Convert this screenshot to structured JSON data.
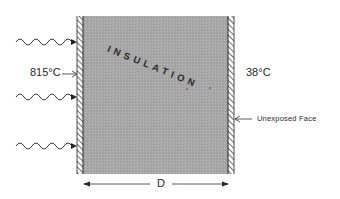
{
  "diagram": {
    "insulation_label": "INSULATION",
    "hot_side_temperature": "815°C",
    "cold_side_temperature": "38°C",
    "unexposed_face_label": "Unexposed Face",
    "thickness_label": "D",
    "heat_input_arrows": 3
  },
  "colors": {
    "insulation_fill": "#a8a8a8",
    "wall_hatch": "#333333",
    "lines": "#222222",
    "background": "#ffffff"
  }
}
